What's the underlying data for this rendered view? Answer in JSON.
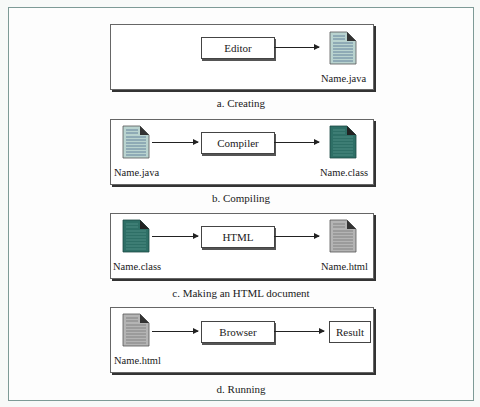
{
  "diagram_title": "Java program development stages",
  "colors": {
    "java_doc": "#b9d3cf",
    "class_doc": "#2e6f66",
    "html_doc": "#b4b4b4",
    "frame_border": "#7d9a96"
  },
  "panels": [
    {
      "caption": "a. Creating",
      "process": "Editor",
      "output": {
        "label": "Name.java",
        "icon": "java-file-icon"
      }
    },
    {
      "caption": "b. Compiling",
      "input": {
        "label": "Name.java",
        "icon": "java-file-icon"
      },
      "process": "Compiler",
      "output": {
        "label": "Name.class",
        "icon": "class-file-icon"
      }
    },
    {
      "caption": "c. Making an HTML document",
      "input": {
        "label": "Name.class",
        "icon": "class-file-icon"
      },
      "process": "HTML",
      "output": {
        "label": "Name.html",
        "icon": "html-file-icon"
      }
    },
    {
      "caption": "d. Running",
      "input": {
        "label": "Name.html",
        "icon": "html-file-icon"
      },
      "process": "Browser",
      "output": {
        "label": "Result"
      }
    }
  ]
}
